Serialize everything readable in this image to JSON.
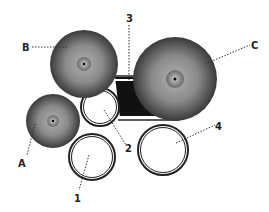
{
  "diagram": {
    "labels": {
      "A": "A",
      "B": "B",
      "C": "C",
      "n1": "1",
      "n2": "2",
      "n3": "3",
      "n4": "4"
    },
    "colors": {
      "background": "#ffffff",
      "cymbal_dark": "#2a2a2a",
      "cymbal_light": "#9a9a9a",
      "bass_drum": "#111111",
      "drum_rim": "#222222",
      "leader_line": "#333333"
    }
  }
}
